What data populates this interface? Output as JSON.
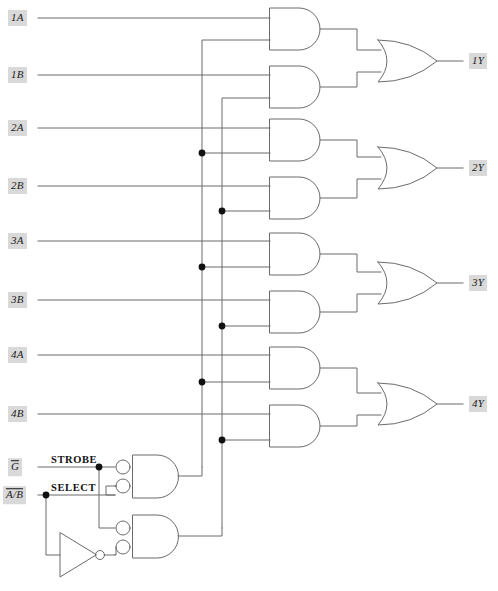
{
  "diagram": {
    "type": "logic-circuit",
    "width": 498,
    "height": 591,
    "background": "#ffffff",
    "wire_color": "#6b6b6b",
    "gate_color": "#6b6b6b",
    "dot_color": "#111111",
    "label_bg": "#d9d9d9",
    "label_fg": "#1a1a1a"
  },
  "inputs": [
    {
      "id": "1A",
      "label": "1A",
      "overline": false,
      "x": 22,
      "y": 18
    },
    {
      "id": "1B",
      "label": "1B",
      "overline": false,
      "x": 22,
      "y": 75
    },
    {
      "id": "2A",
      "label": "2A",
      "overline": false,
      "x": 22,
      "y": 128
    },
    {
      "id": "2B",
      "label": "2B",
      "overline": false,
      "x": 22,
      "y": 186
    },
    {
      "id": "3A",
      "label": "3A",
      "overline": false,
      "x": 22,
      "y": 241
    },
    {
      "id": "3B",
      "label": "3B",
      "overline": false,
      "x": 22,
      "y": 300
    },
    {
      "id": "4A",
      "label": "4A",
      "overline": false,
      "x": 22,
      "y": 355
    },
    {
      "id": "4B",
      "label": "4B",
      "overline": false,
      "x": 22,
      "y": 414
    }
  ],
  "control_inputs": [
    {
      "id": "G",
      "label": "G",
      "overline": true,
      "function": "STROBE",
      "x": 20,
      "y": 467,
      "fn_x": 51,
      "fn_y": 459
    },
    {
      "id": "AB",
      "label": "A/B",
      "overline": true,
      "function": "SELECT",
      "x": 20,
      "y": 495,
      "fn_x": 51,
      "fn_y": 487
    }
  ],
  "outputs": [
    {
      "id": "1Y",
      "label": "1Y",
      "x": 472,
      "y": 61
    },
    {
      "id": "2Y",
      "label": "2Y",
      "x": 472,
      "y": 168
    },
    {
      "id": "3Y",
      "label": "3Y",
      "x": 472,
      "y": 283
    },
    {
      "id": "4Y",
      "label": "4Y",
      "x": 472,
      "y": 404
    }
  ],
  "gates": {
    "and_gates": [
      {
        "id": "and-1a",
        "inputs": [
          "1A",
          "strobe-a-bus"
        ],
        "x": 270,
        "y": 8,
        "w": 58,
        "h": 42
      },
      {
        "id": "and-1b",
        "inputs": [
          "1B",
          "strobe-b-bus"
        ],
        "x": 270,
        "y": 66,
        "w": 58,
        "h": 42
      },
      {
        "id": "and-2a",
        "inputs": [
          "2A",
          "strobe-a-bus"
        ],
        "x": 270,
        "y": 119,
        "w": 58,
        "h": 42
      },
      {
        "id": "and-2b",
        "inputs": [
          "2B",
          "strobe-b-bus"
        ],
        "x": 270,
        "y": 177,
        "w": 58,
        "h": 42
      },
      {
        "id": "and-3a",
        "inputs": [
          "3A",
          "strobe-a-bus"
        ],
        "x": 270,
        "y": 233,
        "w": 58,
        "h": 42
      },
      {
        "id": "and-3b",
        "inputs": [
          "3B",
          "strobe-b-bus"
        ],
        "x": 270,
        "y": 291,
        "w": 58,
        "h": 42
      },
      {
        "id": "and-4a",
        "inputs": [
          "4A",
          "strobe-a-bus"
        ],
        "x": 270,
        "y": 347,
        "w": 58,
        "h": 42
      },
      {
        "id": "and-4b",
        "inputs": [
          "4B",
          "strobe-b-bus"
        ],
        "x": 270,
        "y": 405,
        "w": 58,
        "h": 42
      }
    ],
    "or_gates": [
      {
        "id": "or-1y",
        "output": "1Y",
        "x": 378,
        "y": 40,
        "w": 60,
        "h": 42
      },
      {
        "id": "or-2y",
        "output": "2Y",
        "x": 378,
        "y": 147,
        "w": 60,
        "h": 42
      },
      {
        "id": "or-3y",
        "output": "3Y",
        "x": 378,
        "y": 262,
        "w": 60,
        "h": 42
      },
      {
        "id": "or-4y",
        "output": "4Y",
        "x": 378,
        "y": 383,
        "w": 60,
        "h": 42
      }
    ],
    "nand_gates": [
      {
        "id": "nand-a",
        "note": "negated-input AND driving A bus",
        "x": 133,
        "y": 455,
        "w": 47,
        "h": 43,
        "bubbles": 2
      },
      {
        "id": "nand-b",
        "note": "negated-input AND driving B bus",
        "x": 133,
        "y": 515,
        "w": 47,
        "h": 43,
        "bubbles": 2
      }
    ],
    "inverters": [
      {
        "id": "inv-select",
        "x": 46,
        "y": 533,
        "w": 44,
        "h": 44
      }
    ]
  },
  "junction_dots": [
    {
      "id": "dot-a-2",
      "x": 202,
      "y": 153
    },
    {
      "id": "dot-b-2",
      "x": 222,
      "y": 211
    },
    {
      "id": "dot-a-3",
      "x": 202,
      "y": 267
    },
    {
      "id": "dot-b-3",
      "x": 222,
      "y": 326
    },
    {
      "id": "dot-a-4",
      "x": 202,
      "y": 382
    },
    {
      "id": "dot-b-4",
      "x": 222,
      "y": 440
    },
    {
      "id": "dot-strobe",
      "x": 99,
      "y": 467
    },
    {
      "id": "dot-select",
      "x": 46,
      "y": 495
    }
  ],
  "buses": [
    {
      "id": "strobe-a-bus",
      "x": 202,
      "from_y": 40,
      "to_y": 467,
      "feeds": [
        "and-1a",
        "and-2a",
        "and-3a",
        "and-4a"
      ]
    },
    {
      "id": "strobe-b-bus",
      "x": 222,
      "from_y": 98,
      "to_y": 528,
      "feeds": [
        "and-1b",
        "and-2b",
        "and-3b",
        "and-4b"
      ]
    }
  ]
}
